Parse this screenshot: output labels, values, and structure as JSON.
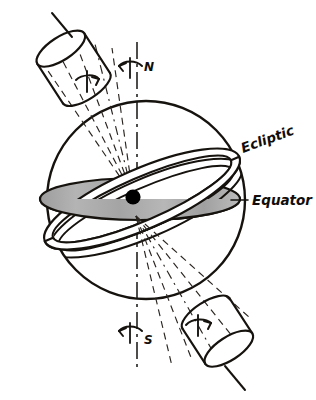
{
  "figure": {
    "background_color": "#ffffff",
    "ink_color": "#16130f",
    "disk_fill_color": "#a8a8a8",
    "center_dot_color": "#000000",
    "width": 316,
    "height": 400
  },
  "labels": {
    "ecliptic": "Ecliptic",
    "equator": "Equator",
    "north_pole": "N",
    "south_pole": "S"
  },
  "elements": {
    "celestial_sphere": {
      "name": "celestial-sphere-outline",
      "center_x": 146,
      "center_y": 200,
      "radius": 99
    },
    "rotation_axis": {
      "name": "rotation-axis",
      "style": "dash-dot",
      "x": 137,
      "y_top": 42,
      "y_bottom": 372
    },
    "equator_disk": {
      "name": "equator-disk",
      "center_x": 140,
      "center_y": 199,
      "rx": 100,
      "ry": 21,
      "fill": "#a8a8a8"
    },
    "ecliptic_band": {
      "name": "ecliptic-band",
      "tilt_degrees": -23.5,
      "fill": "#ffffff"
    },
    "center_body": {
      "name": "earth-center-dot",
      "cx": 133,
      "cy": 197,
      "r": 7.5
    },
    "upper_cone": {
      "name": "upper-precession-cone",
      "direction": "upper-left",
      "line_count": 5
    },
    "lower_cone": {
      "name": "lower-precession-cone",
      "direction": "lower-right",
      "line_count": 5
    },
    "upper_cylinder": {
      "name": "upper-precession-cylinder",
      "cx": 63,
      "cy": 50
    },
    "lower_cylinder": {
      "name": "lower-precession-cylinder",
      "cx": 231,
      "cy": 352
    }
  },
  "rotation_arrows": {
    "north_axis_arrow": {
      "name": "north-rotation-arrow",
      "direction": "counterclockwise"
    },
    "south_axis_arrow": {
      "name": "south-rotation-arrow",
      "direction": "counterclockwise"
    },
    "upper_cylinder_arrow": {
      "name": "upper-cylinder-rotation-arrow",
      "direction": "clockwise"
    },
    "lower_cylinder_arrow": {
      "name": "lower-cylinder-rotation-arrow",
      "direction": "clockwise"
    }
  }
}
